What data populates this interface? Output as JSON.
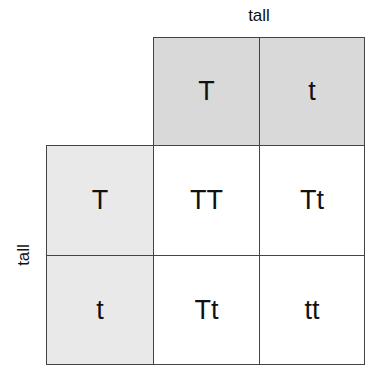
{
  "labels": {
    "top": "tall",
    "side": "tall"
  },
  "header_top": [
    "T",
    "t"
  ],
  "header_left": [
    "T",
    "t"
  ],
  "grid": [
    [
      "TT",
      "Tt"
    ],
    [
      "Tt",
      "tt"
    ]
  ],
  "colors": {
    "header_top_fill": "#d9d9d9",
    "header_left_fill": "#e9e9e9",
    "inner_fill": "#ffffff",
    "border": "#444444"
  }
}
